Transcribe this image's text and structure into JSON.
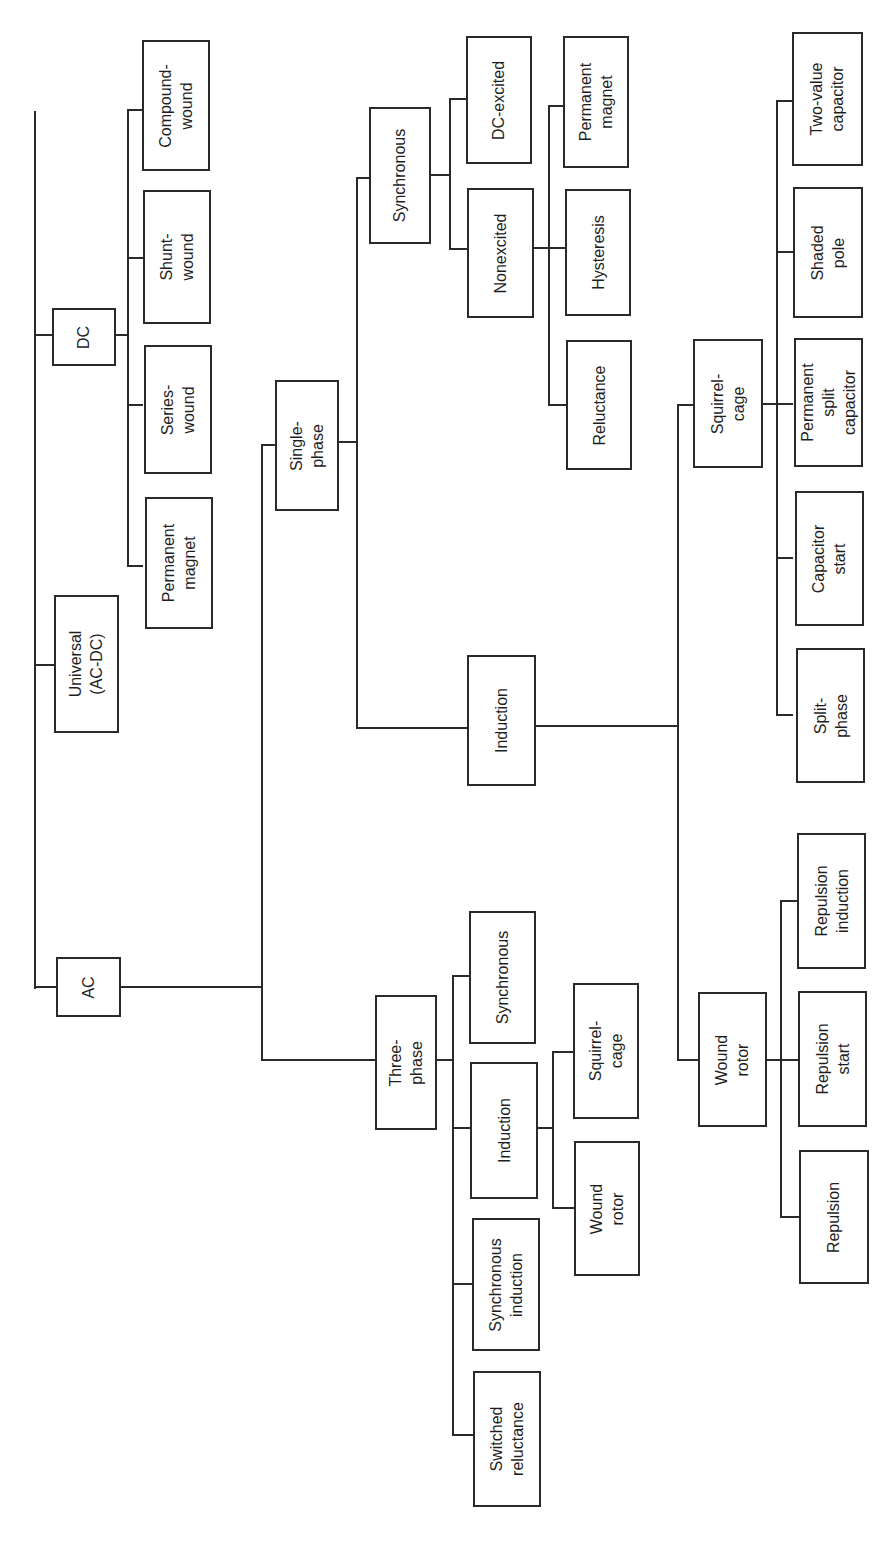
{
  "diagram": {
    "orientation": "rotated 90 degrees counter-clockwise",
    "line_color": "#2a2a2a",
    "background": "#ffffff",
    "nodes": {
      "dc": "DC",
      "dc_compound": "Compound-\nwound",
      "dc_shunt": "Shunt-\nwound",
      "dc_series": "Series-\nwound",
      "dc_pm": "Permanent\nmagnet",
      "universal": "Universal\n(AC-DC)",
      "ac": "AC",
      "single_phase": "Single-\nphase",
      "sp_synchronous": "Synchronous",
      "sp_dc_excited": "DC-excited",
      "sp_nonexcited": "Nonexcited",
      "sp_pm": "Permanent\nmagnet",
      "sp_hysteresis": "Hysteresis",
      "sp_reluctance": "Reluctance",
      "sp_induction": "Induction",
      "sp_squirrel_cage": "Squirrel-\ncage",
      "sp_two_value": "Two-value\ncapacitor",
      "sp_shaded_pole": "Shaded\npole",
      "sp_psc": "Permanent\nsplit\ncapacitor",
      "sp_cap_start": "Capacitor\nstart",
      "sp_split_phase": "Split-\nphase",
      "sp_wound_rotor": "Wound\nrotor",
      "sp_rep_induction": "Repulsion\ninduction",
      "sp_rep_start": "Repulsion\nstart",
      "sp_repulsion": "Repulsion",
      "three_phase": "Three-\nphase",
      "tp_synchronous": "Synchronous",
      "tp_induction": "Induction",
      "tp_sync_induction": "Synchronous\ninduction",
      "tp_switched_rel": "Switched\nreluctance",
      "tp_squirrel_cage": "Squirrel-\ncage",
      "tp_wound_rotor": "Wound\nrotor"
    }
  }
}
